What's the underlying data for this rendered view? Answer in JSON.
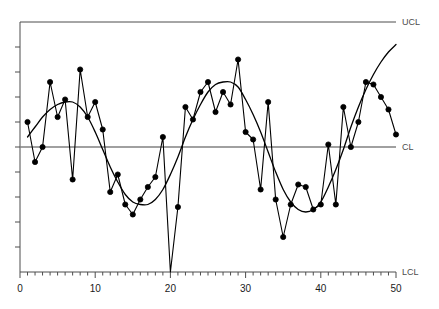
{
  "chart_data": {
    "type": "line",
    "title": "",
    "subtitle": "",
    "xlabel": "",
    "ylabel": "",
    "xlim": [
      0,
      50
    ],
    "ylim": [
      0,
      100
    ],
    "xticks_major": [
      0,
      10,
      20,
      30,
      40,
      50
    ],
    "xticks_minor_step": 1,
    "yticks_count": 10,
    "ytick_labels": [],
    "grid": false,
    "legend_position": "none",
    "annotations": [
      {
        "name": "UCL",
        "label": "UCL",
        "value": 100,
        "type": "control-limit-upper"
      },
      {
        "name": "CL",
        "label": "CL",
        "value": 50,
        "type": "center-line"
      },
      {
        "name": "LCL",
        "label": "LCL",
        "value": 0,
        "type": "control-limit-lower"
      }
    ],
    "x": [
      1,
      2,
      3,
      4,
      5,
      6,
      7,
      8,
      9,
      10,
      11,
      12,
      13,
      14,
      15,
      16,
      17,
      18,
      19,
      20,
      21,
      22,
      23,
      24,
      25,
      26,
      27,
      28,
      29,
      30,
      31,
      32,
      33,
      34,
      35,
      36,
      37,
      38,
      39,
      40,
      41,
      42,
      43,
      44,
      45,
      46,
      47,
      48,
      49,
      50
    ],
    "series": [
      {
        "name": "Individual observations",
        "type": "line-with-markers",
        "color": "#000000",
        "marker": "filled-circle",
        "values": [
          60,
          44,
          50,
          76,
          62,
          69,
          37,
          81,
          62,
          68,
          57,
          32,
          39,
          27,
          23,
          29,
          34,
          38,
          54,
          0,
          26,
          66,
          61,
          72,
          76,
          64,
          72,
          67,
          85,
          56,
          53,
          33,
          68,
          29,
          14,
          27,
          35,
          34,
          25,
          27,
          51,
          27,
          66,
          50,
          60,
          76,
          75,
          70,
          65,
          55
        ]
      },
      {
        "name": "Fitted trend curve",
        "type": "smooth-curve",
        "color": "#000000",
        "marker": "none",
        "values": [
          54,
          58,
          62,
          65,
          67,
          68,
          68,
          66,
          62,
          56,
          49,
          42,
          36,
          31,
          28,
          27,
          27,
          29,
          33,
          39,
          46,
          54,
          61,
          67,
          72,
          75,
          76,
          76,
          74,
          69,
          63,
          56,
          48,
          40,
          33,
          28,
          25,
          24,
          25,
          28,
          34,
          41,
          49,
          58,
          66,
          73,
          79,
          84,
          88,
          91
        ]
      }
    ]
  },
  "axis": {
    "x_tick_labels": [
      "0",
      "10",
      "20",
      "30",
      "40",
      "50"
    ]
  },
  "limits": {
    "ucl_label": "UCL",
    "cl_label": "CL",
    "lcl_label": "LCL"
  },
  "colors": {
    "frame": "#4d4d4d",
    "center_line": "#808080",
    "data_line": "#000000",
    "curve": "#000000",
    "marker": "#000000",
    "tick_label": "#1a1a1a",
    "limit_label": "#4d4d4d",
    "background": "#ffffff"
  }
}
